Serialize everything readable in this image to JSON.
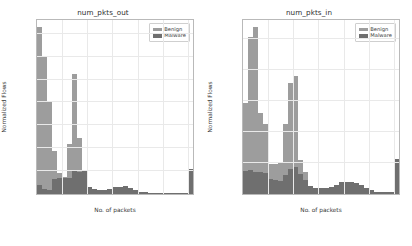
{
  "figure": {
    "panels": [
      "out",
      "in"
    ]
  },
  "legend": {
    "benign_label": "Benign",
    "malware_label": "Malware",
    "benign_color": "#9d9d9d",
    "malware_color": "#6f6f6f"
  },
  "chart_data": [
    {
      "type": "bar",
      "title": "num_pkts_out",
      "xlabel": "No. of packets",
      "ylabel": "Normalized Flows",
      "xlim": [
        0,
        62
      ],
      "ylim": [
        0,
        38
      ],
      "grid": true,
      "legend_position": "upper right",
      "xticks": [
        0,
        10,
        20,
        30,
        40,
        50,
        60
      ],
      "xticklabels": [
        "0",
        "10",
        "20",
        "30",
        "40",
        "50",
        "60+"
      ],
      "yticks": [
        0,
        5,
        10,
        15,
        20,
        25,
        30,
        35
      ],
      "yticklabels": [
        "0.0%",
        "5.0%",
        "10.0%",
        "15.0%",
        "20.0%",
        "25.0%",
        "30.0%",
        "35.0%"
      ],
      "x": [
        1,
        3,
        5,
        7,
        9,
        11,
        13,
        15,
        17,
        19,
        21,
        23,
        25,
        27,
        29,
        31,
        33,
        35,
        37,
        39,
        41,
        43,
        45,
        47,
        49,
        51,
        53,
        55,
        57,
        59,
        61
      ],
      "bin_width": 2,
      "series": [
        {
          "name": "Benign",
          "values": [
            36.5,
            30.0,
            20.0,
            9.5,
            4.6,
            3.8,
            10.9,
            26.2,
            12.2,
            5.0,
            1.6,
            0.8,
            0.6,
            0.5,
            0.5,
            0.5,
            0.5,
            0.5,
            0.4,
            0.3,
            0.2,
            0.2,
            0.2,
            0.2,
            0.2,
            0.1,
            0.1,
            0.1,
            0.1,
            0.1,
            5.4
          ]
        },
        {
          "name": "Malware",
          "values": [
            2.0,
            1.0,
            0.9,
            3.2,
            3.4,
            3.4,
            3.6,
            5.0,
            4.9,
            5.0,
            1.5,
            1.0,
            0.8,
            0.9,
            1.2,
            1.5,
            1.6,
            1.7,
            1.4,
            0.9,
            0.5,
            0.4,
            0.3,
            0.3,
            0.3,
            0.2,
            0.2,
            0.2,
            0.2,
            0.2,
            5.4
          ]
        }
      ]
    },
    {
      "type": "bar",
      "title": "num_pkts_in",
      "xlabel": "No. of packets",
      "ylabel": "Normalized Flows",
      "xlim": [
        0,
        62
      ],
      "ylim": [
        0,
        28
      ],
      "grid": true,
      "legend_position": "upper right",
      "xticks": [
        0,
        10,
        20,
        30,
        40,
        50,
        60
      ],
      "xticklabels": [
        "0",
        "10",
        "20",
        "30",
        "40",
        "50",
        "60+"
      ],
      "yticks": [
        0,
        5,
        10,
        15,
        20,
        25
      ],
      "yticklabels": [
        "0.0%",
        "5.0%",
        "10.0%",
        "15.0%",
        "20.0%",
        "25.0%"
      ],
      "x": [
        1,
        3,
        5,
        7,
        9,
        11,
        13,
        15,
        17,
        19,
        21,
        23,
        25,
        27,
        29,
        31,
        33,
        35,
        37,
        39,
        41,
        43,
        45,
        47,
        49,
        51,
        53,
        55,
        57,
        59,
        61
      ],
      "bin_width": 2,
      "series": [
        {
          "name": "Benign",
          "values": [
            14.6,
            25.2,
            26.9,
            13.0,
            11.2,
            4.9,
            4.9,
            5.2,
            11.3,
            17.8,
            19.0,
            5.5,
            3.6,
            1.2,
            0.8,
            0.7,
            0.7,
            0.7,
            0.6,
            0.6,
            0.5,
            0.5,
            0.5,
            0.4,
            0.4,
            0.4,
            0.3,
            0.3,
            0.3,
            0.3,
            5.6
          ]
        },
        {
          "name": "Malware",
          "values": [
            3.7,
            3.8,
            3.6,
            3.5,
            3.4,
            2.4,
            2.2,
            2.1,
            3.1,
            4.0,
            4.4,
            3.2,
            2.2,
            1.3,
            1.0,
            1.0,
            1.0,
            1.2,
            1.5,
            1.9,
            2.0,
            2.0,
            1.8,
            1.4,
            0.9,
            0.6,
            0.4,
            0.3,
            0.3,
            0.3,
            5.6
          ]
        }
      ]
    }
  ]
}
